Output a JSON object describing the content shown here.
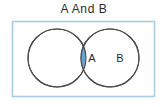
{
  "figure": {
    "title": "A And B",
    "type": "venn-diagram",
    "universe_label": "",
    "sets": [
      {
        "label": "A",
        "cx": 57,
        "cy": 58,
        "r": 29
      },
      {
        "label": "B",
        "cx": 110,
        "cy": 58,
        "r": 29
      }
    ],
    "shaded_region": "intersection",
    "universe_rect": {
      "x": 12,
      "y": 21,
      "width": 143,
      "height": 76
    },
    "colors": {
      "background": "#ffffff",
      "title_text": "#2b2b2b",
      "universe_border": "#a9cce3",
      "circle_stroke": "#4a4a4a",
      "circle_fill": "#ffffff",
      "intersection_fill": "#6ba3d0",
      "label_text": "#2b2b2b"
    }
  }
}
